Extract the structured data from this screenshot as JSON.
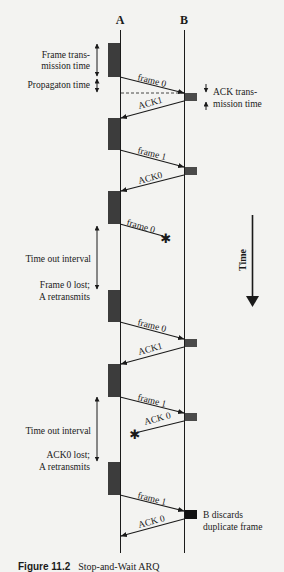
{
  "figure": {
    "caption_number": "Figure 11.2",
    "caption_title": "Stop-and-Wait ARQ",
    "station_a": "A",
    "station_b": "B",
    "time_axis_label": "Time",
    "annotations": {
      "frame_tx_line1": "Frame trans-",
      "frame_tx_line2": "mission time",
      "propagation": "Propagaton time",
      "ack_tx_line1": "ACK trans-",
      "ack_tx_line2": "mission time",
      "timeout1": "Time out interval",
      "lost1_line1": "Frame 0 lost;",
      "lost1_line2": "A retransmits",
      "timeout2": "Time out interval",
      "lost2_line1": "ACK0 lost;",
      "lost2_line2": "A retransmits",
      "discard_line1": "B discards",
      "discard_line2": "duplicate frame"
    },
    "messages": [
      {
        "label": "frame 0",
        "direction": "A->B",
        "status": "delivered"
      },
      {
        "label": "ACK1",
        "direction": "B->A",
        "status": "delivered"
      },
      {
        "label": "frame 1",
        "direction": "A->B",
        "status": "delivered"
      },
      {
        "label": "ACK0",
        "direction": "B->A",
        "status": "delivered"
      },
      {
        "label": "frame 0",
        "direction": "A->B",
        "status": "lost"
      },
      {
        "label": "frame 0",
        "direction": "A->B",
        "status": "delivered"
      },
      {
        "label": "ACK1",
        "direction": "B->A",
        "status": "delivered"
      },
      {
        "label": "frame 1",
        "direction": "A->B",
        "status": "delivered"
      },
      {
        "label": "ACK 0",
        "direction": "B->A",
        "status": "lost"
      },
      {
        "label": "frame 1",
        "direction": "A->B",
        "status": "delivered"
      },
      {
        "label": "ACK 0",
        "direction": "B->A",
        "status": "delivered"
      }
    ],
    "colors": {
      "background": "#f3f3f1",
      "line": "#1a1a1a",
      "frame_block": "#3c3c3c",
      "ack_block": "#4a4a4a",
      "dup_block": "#111111"
    }
  }
}
